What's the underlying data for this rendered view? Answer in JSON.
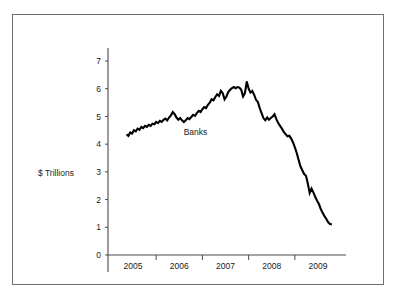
{
  "figure": {
    "name": "banks-assets-line-chart",
    "frame_border_color": "#6e6e73",
    "background_color": "#ffffff"
  },
  "chart_data": {
    "type": "line",
    "title": "",
    "xlabel": "",
    "ylabel": "$ Trillions",
    "ylim": [
      0,
      7.6
    ],
    "xlim": [
      2004.72,
      2009.18
    ],
    "grid": false,
    "legend": "inline-label",
    "series": [
      {
        "name": "Banks",
        "color": "#000000",
        "label_text": "Banks",
        "label_x": 2006.35,
        "label_y": 4.32,
        "points": [
          [
            2004.86,
            4.35
          ],
          [
            2004.9,
            4.3
          ],
          [
            2004.94,
            4.42
          ],
          [
            2004.98,
            4.38
          ],
          [
            2005.02,
            4.5
          ],
          [
            2005.06,
            4.46
          ],
          [
            2005.1,
            4.56
          ],
          [
            2005.14,
            4.52
          ],
          [
            2005.18,
            4.62
          ],
          [
            2005.22,
            4.58
          ],
          [
            2005.26,
            4.66
          ],
          [
            2005.3,
            4.62
          ],
          [
            2005.34,
            4.7
          ],
          [
            2005.38,
            4.66
          ],
          [
            2005.42,
            4.74
          ],
          [
            2005.46,
            4.72
          ],
          [
            2005.5,
            4.8
          ],
          [
            2005.54,
            4.76
          ],
          [
            2005.58,
            4.84
          ],
          [
            2005.62,
            4.8
          ],
          [
            2005.66,
            4.88
          ],
          [
            2005.7,
            4.92
          ],
          [
            2005.74,
            4.86
          ],
          [
            2005.78,
            4.96
          ],
          [
            2005.82,
            5.04
          ],
          [
            2005.86,
            5.16
          ],
          [
            2005.9,
            5.08
          ],
          [
            2005.94,
            4.96
          ],
          [
            2005.98,
            4.88
          ],
          [
            2006.02,
            4.94
          ],
          [
            2006.06,
            4.86
          ],
          [
            2006.1,
            4.8
          ],
          [
            2006.14,
            4.86
          ],
          [
            2006.18,
            4.94
          ],
          [
            2006.22,
            4.9
          ],
          [
            2006.26,
            4.98
          ],
          [
            2006.3,
            5.06
          ],
          [
            2006.34,
            5.02
          ],
          [
            2006.38,
            5.12
          ],
          [
            2006.42,
            5.2
          ],
          [
            2006.46,
            5.16
          ],
          [
            2006.5,
            5.26
          ],
          [
            2006.54,
            5.34
          ],
          [
            2006.58,
            5.3
          ],
          [
            2006.62,
            5.42
          ],
          [
            2006.66,
            5.5
          ],
          [
            2006.7,
            5.62
          ],
          [
            2006.74,
            5.58
          ],
          [
            2006.78,
            5.7
          ],
          [
            2006.82,
            5.8
          ],
          [
            2006.86,
            5.74
          ],
          [
            2006.9,
            5.92
          ],
          [
            2006.94,
            5.84
          ],
          [
            2006.98,
            5.62
          ],
          [
            2007.02,
            5.72
          ],
          [
            2007.06,
            5.88
          ],
          [
            2007.1,
            5.96
          ],
          [
            2007.14,
            6.02
          ],
          [
            2007.18,
            6.06
          ],
          [
            2007.22,
            6.02
          ],
          [
            2007.26,
            6.06
          ],
          [
            2007.3,
            6.04
          ],
          [
            2007.34,
            5.96
          ],
          [
            2007.38,
            5.72
          ],
          [
            2007.42,
            5.84
          ],
          [
            2007.46,
            6.26
          ],
          [
            2007.5,
            6.0
          ],
          [
            2007.54,
            5.86
          ],
          [
            2007.58,
            5.92
          ],
          [
            2007.62,
            5.78
          ],
          [
            2007.66,
            5.6
          ],
          [
            2007.7,
            5.52
          ],
          [
            2007.74,
            5.3
          ],
          [
            2007.78,
            5.12
          ],
          [
            2007.82,
            4.94
          ],
          [
            2007.86,
            4.86
          ],
          [
            2007.9,
            4.96
          ],
          [
            2007.94,
            4.88
          ],
          [
            2007.98,
            4.94
          ],
          [
            2008.02,
            5.0
          ],
          [
            2008.06,
            5.08
          ],
          [
            2008.1,
            4.9
          ],
          [
            2008.14,
            4.76
          ],
          [
            2008.18,
            4.66
          ],
          [
            2008.22,
            4.56
          ],
          [
            2008.26,
            4.44
          ],
          [
            2008.3,
            4.36
          ],
          [
            2008.34,
            4.28
          ],
          [
            2008.38,
            4.3
          ],
          [
            2008.42,
            4.2
          ],
          [
            2008.46,
            4.06
          ],
          [
            2008.5,
            3.88
          ],
          [
            2008.54,
            3.68
          ],
          [
            2008.58,
            3.44
          ],
          [
            2008.62,
            3.2
          ],
          [
            2008.66,
            3.06
          ],
          [
            2008.7,
            2.92
          ],
          [
            2008.74,
            2.86
          ],
          [
            2008.78,
            2.58
          ],
          [
            2008.82,
            2.24
          ],
          [
            2008.86,
            2.4
          ],
          [
            2008.9,
            2.26
          ],
          [
            2008.94,
            2.1
          ],
          [
            2008.98,
            1.96
          ],
          [
            2009.02,
            1.84
          ],
          [
            2009.06,
            1.66
          ],
          [
            2009.1,
            1.52
          ],
          [
            2009.14,
            1.4
          ],
          [
            2009.18,
            1.3
          ],
          [
            2009.22,
            1.18
          ],
          [
            2009.26,
            1.12
          ],
          [
            2009.3,
            1.1
          ]
        ]
      }
    ],
    "yticks": [
      {
        "value": 0,
        "label": "0"
      },
      {
        "value": 1,
        "label": "1"
      },
      {
        "value": 2,
        "label": "2"
      },
      {
        "value": 3,
        "label": "3"
      },
      {
        "value": 4,
        "label": "4"
      },
      {
        "value": 5,
        "label": "5"
      },
      {
        "value": 6,
        "label": "6"
      },
      {
        "value": 7,
        "label": "7"
      }
    ],
    "xticks": [
      {
        "value": 2005.0,
        "label": "2005"
      },
      {
        "value": 2006.0,
        "label": "2006"
      },
      {
        "value": 2007.0,
        "label": "2007"
      },
      {
        "value": 2008.0,
        "label": "2008"
      },
      {
        "value": 2009.0,
        "label": "2009"
      }
    ],
    "x_minor_ticks": [
      2005.5,
      2006.5,
      2007.5,
      2008.5
    ]
  }
}
